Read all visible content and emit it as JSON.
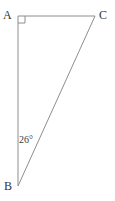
{
  "figure": {
    "type": "geometry-diagram",
    "shape": "right-triangle",
    "background_color": "#ffffff",
    "stroke_color": "#8e8e8e",
    "stroke_width": 1,
    "label_color": "#333333",
    "width": 115,
    "height": 201
  },
  "vertices": [
    {
      "name": "A",
      "label": "A",
      "x": 18,
      "y": 16
    },
    {
      "name": "C",
      "label": "C",
      "x": 95,
      "y": 16
    },
    {
      "name": "B",
      "label": "B",
      "x": 18,
      "y": 186
    }
  ],
  "sides": [
    {
      "name": "AC",
      "from": "A",
      "to": "C"
    },
    {
      "name": "AB",
      "from": "A",
      "to": "B"
    },
    {
      "name": "BC",
      "from": "B",
      "to": "C"
    }
  ],
  "angles": [
    {
      "name": "angle-A",
      "at": "A",
      "marker": "right-angle-square",
      "value": "90",
      "label": "",
      "size": 7
    },
    {
      "name": "angle-B",
      "at": "B",
      "marker": "none",
      "value": "26",
      "label": "26°"
    }
  ],
  "markers": {
    "right_angle_square": {
      "name": "right-angle-marker",
      "x": 18,
      "y": 16,
      "size": 7
    }
  }
}
